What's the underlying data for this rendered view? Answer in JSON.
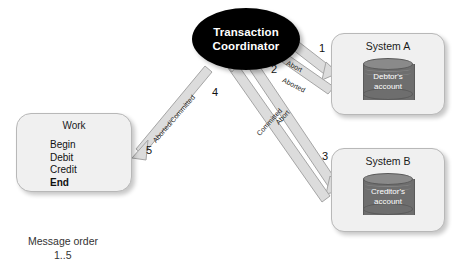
{
  "diagram": {
    "title_caption": "Message order",
    "caption_range": "1..5",
    "coordinator": {
      "line1": "Transaction",
      "line2": "Coordinator"
    },
    "system_a": {
      "title": "System A",
      "db_line1": "Debtor's",
      "db_line2": "account"
    },
    "system_b": {
      "title": "System B",
      "db_line1": "Creditor's",
      "db_line2": "account"
    },
    "work": {
      "title": "Work",
      "step1": "Begin",
      "step2": "Debit",
      "step3": "Credit",
      "step4": "End"
    },
    "sequence": {
      "n1": "1",
      "n2": "2",
      "n3": "3",
      "n4": "4",
      "n5": "5"
    },
    "arrow_labels": {
      "abort_a": "Abort",
      "aborted_a": "Aborted",
      "abort_b": "Abort",
      "committed_b": "Committed",
      "work_result": "Aborted/Committed"
    },
    "colors": {
      "coordinator_fill": "#000000",
      "coordinator_text": "#ffffff",
      "box_fill": "#f0f0f0",
      "box_border": "#b8b8b8",
      "cylinder_fill": "#6e6e6e",
      "cylinder_top": "#8a8a8a",
      "arrow_fill": "#d8d8d8",
      "arrow_stroke": "#9a9a9a"
    }
  }
}
